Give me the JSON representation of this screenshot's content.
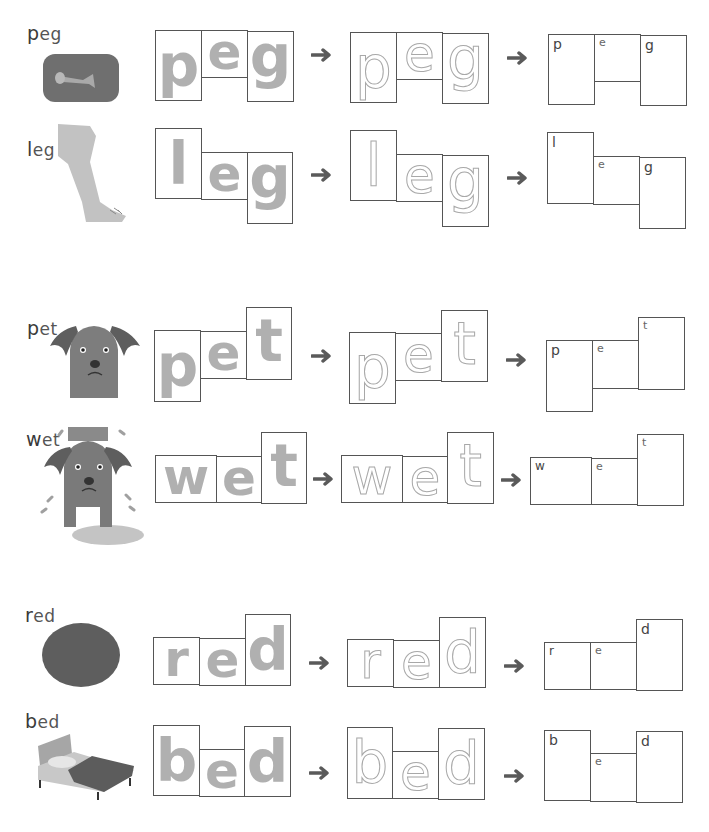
{
  "worksheet": {
    "rows": [
      {
        "word": "peg",
        "first": "p",
        "rest": "eg",
        "picture": "peg-picture",
        "letters": [
          "p",
          "e",
          "g"
        ]
      },
      {
        "word": "leg",
        "first": "l",
        "rest": "eg",
        "picture": "leg-picture",
        "letters": [
          "l",
          "e",
          "g"
        ]
      },
      {
        "word": "pet",
        "first": "p",
        "rest": "et",
        "picture": "dog-picture",
        "letters": [
          "p",
          "e",
          "t"
        ]
      },
      {
        "word": "wet",
        "first": "w",
        "rest": "et",
        "picture": "wet-dog-picture",
        "letters": [
          "w",
          "e",
          "t"
        ]
      },
      {
        "word": "red",
        "first": "r",
        "rest": "ed",
        "picture": "red-circle-picture",
        "letters": [
          "r",
          "e",
          "d"
        ]
      },
      {
        "word": "bed",
        "first": "b",
        "rest": "ed",
        "picture": "bed-picture",
        "letters": [
          "b",
          "e",
          "d"
        ]
      }
    ],
    "arrow_icon": "right-arrow-icon",
    "colors": {
      "box_border": "#555555",
      "trace_letter": "#b0b0b0",
      "dashed_letter": "#a8a8a8",
      "arrow": "#5a5a5a",
      "picture_gray": "#7a7a7a"
    }
  }
}
